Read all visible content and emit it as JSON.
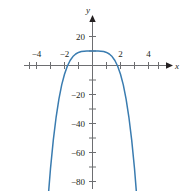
{
  "chart_data": {
    "type": "line",
    "title": "",
    "xlabel": "x",
    "ylabel": "y",
    "xlim": [
      -5,
      5
    ],
    "ylim": [
      -105,
      25
    ],
    "grid": false,
    "legend": null,
    "x_ticks_labeled": [
      -4,
      -2,
      2,
      4
    ],
    "x_tick_labels": [
      "−4",
      "−2",
      "2",
      "4"
    ],
    "x_ticks_all": [
      -4.5,
      -4,
      -3.5,
      -3,
      -2.5,
      -2,
      -1.5,
      -1,
      -0.5,
      0.5,
      1,
      1.5,
      2,
      2.5,
      3,
      3.5,
      4,
      4.5
    ],
    "y_ticks_labeled": [
      20,
      -20,
      -40,
      -60,
      -80,
      -100
    ],
    "y_tick_labels": [
      "20",
      "−20",
      "−40",
      "−60",
      "−80",
      "−100"
    ],
    "y_ticks_all": [
      20,
      10,
      -10,
      -20,
      -30,
      -40,
      -50,
      -60,
      -70,
      -80,
      -90,
      -100
    ],
    "series": [
      {
        "name": "y = 10 − x⁴",
        "color": "#3a7cb0",
        "x": [
          -3.33,
          -3.2,
          -3.0,
          -2.8,
          -2.6,
          -2.4,
          -2.2,
          -2.0,
          -1.8,
          -1.6,
          -1.4,
          -1.2,
          -1.0,
          -0.8,
          -0.6,
          -0.4,
          -0.2,
          0,
          0.2,
          0.4,
          0.6,
          0.8,
          1.0,
          1.2,
          1.4,
          1.6,
          1.8,
          2.0,
          2.2,
          2.4,
          2.6,
          2.8,
          3.0,
          3.2,
          3.33
        ],
        "y": [
          -113,
          -95,
          -71,
          -51.5,
          -35.7,
          -23.2,
          -13.4,
          -6,
          -0.5,
          3.45,
          6.16,
          7.93,
          9,
          9.59,
          9.87,
          9.97,
          9.99,
          10,
          9.99,
          9.97,
          9.87,
          9.59,
          9,
          7.93,
          6.16,
          3.45,
          -0.5,
          -6,
          -13.4,
          -23.2,
          -35.7,
          -51.5,
          -71,
          -95,
          -113
        ]
      }
    ],
    "axis_arrows": [
      "x-positive",
      "y-positive"
    ]
  },
  "labels": {
    "y_axis_name": "y",
    "x_axis_name": "x",
    "y_20": "20",
    "y_m20": "−20",
    "y_m40": "−40",
    "y_m60": "−60",
    "y_m80": "−80",
    "y_m100": "−100",
    "x_m4": "−4",
    "x_m2": "−2",
    "x_2": "2",
    "x_4": "4"
  },
  "colors": {
    "curve": "#3a7cb0",
    "axis": "#6d6e71",
    "text": "#231f20",
    "background": "#ffffff"
  }
}
